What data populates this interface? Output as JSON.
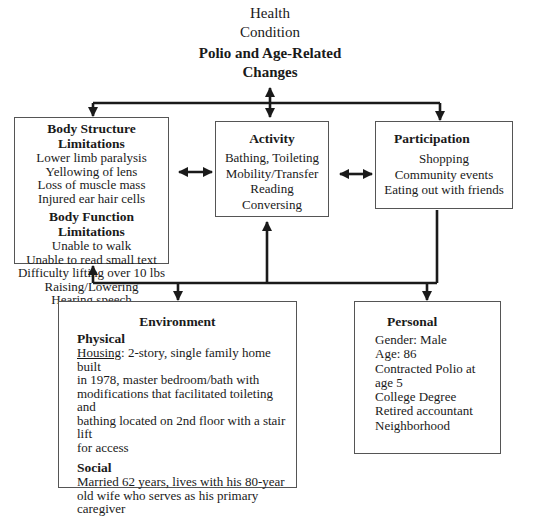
{
  "health_condition": {
    "label_lines": [
      "Health",
      "Condition"
    ],
    "title_lines": [
      "Polio and Age-Related",
      "Changes"
    ]
  },
  "body_box": {
    "structure_header": "Body Structure Limitations",
    "structure_items": [
      "Lower limb paralysis",
      "Yellowing of lens",
      "Loss of muscle mass",
      "Injured ear hair cells"
    ],
    "function_header": "Body Function Limitations",
    "function_items": [
      "Unable to walk",
      "Unable to read small text",
      "Difficulty lifting over 10 lbs",
      "Raising/Lowering",
      "Hearing speech"
    ]
  },
  "activity_box": {
    "header": "Activity",
    "items": [
      "Bathing, Toileting",
      "Mobility/Transfer",
      "Reading",
      "Conversing"
    ]
  },
  "participation_box": {
    "header": "Participation",
    "items": [
      "Shopping",
      "Community events",
      "Eating out with friends"
    ]
  },
  "environment_box": {
    "header": "Environment",
    "physical_header": "Physical",
    "housing_label": "Housing",
    "housing_lines": [
      ": 2-story, single family home built",
      "in 1978, master bedroom/bath with",
      "modifications that facilitated toileting and",
      "bathing located on 2nd floor with a stair lift",
      "for access"
    ],
    "social_header": "Social",
    "social_lines": [
      "Married 62 years, lives with his 80-year",
      "old wife who serves as his primary",
      "caregiver"
    ]
  },
  "personal_box": {
    "header": "Personal",
    "items": [
      "Gender: Male",
      "Age: 86",
      "Contracted Polio at",
      "age 5",
      "College Degree",
      "Retired accountant",
      "Neighborhood"
    ]
  },
  "colors": {
    "line": "#1a1a1a",
    "box_border": "#555555",
    "text": "#1a1a1a"
  }
}
